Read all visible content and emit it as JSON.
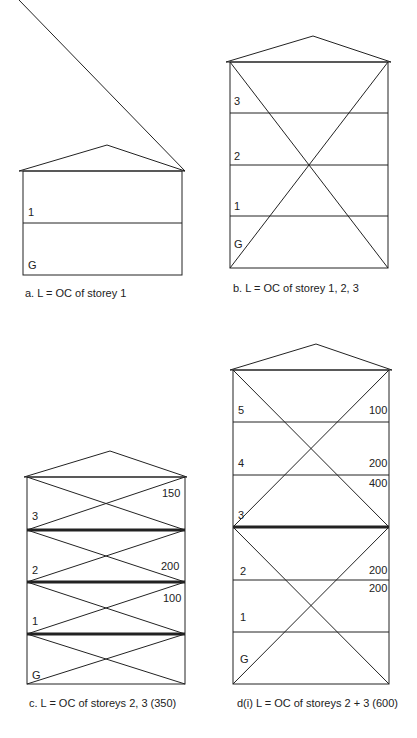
{
  "figures": [
    {
      "id": "a",
      "caption": "a. L = OC of storey 1",
      "storey_labels": [
        "1",
        "G"
      ],
      "load_labels": [],
      "heavy_floors": []
    },
    {
      "id": "b",
      "caption": "b. L = OC of storey 1, 2, 3",
      "storey_labels": [
        "3",
        "2",
        "1",
        "G"
      ],
      "load_labels": [],
      "heavy_floors": []
    },
    {
      "id": "c",
      "caption": "c. L = OC of storeys 2, 3 (350)",
      "storey_labels": [
        "3",
        "2",
        "1",
        "G"
      ],
      "load_labels": [
        "150",
        "200",
        "100"
      ],
      "heavy_floors": [
        "3",
        "2",
        "1"
      ]
    },
    {
      "id": "d",
      "caption": "d(i) L = OC of storeys 2 + 3 (600)",
      "storey_labels": [
        "5",
        "4",
        "3",
        "2",
        "1",
        "G"
      ],
      "load_labels": [
        "100",
        "200",
        "400",
        "200",
        "200"
      ],
      "heavy_floors": [
        "3"
      ]
    }
  ]
}
